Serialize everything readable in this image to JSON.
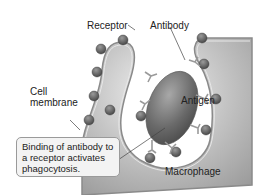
{
  "diagram": {
    "type": "biology-illustration",
    "labels": {
      "receptor": "Receptor",
      "antibody": "Antibody",
      "cell_membrane": "Cell\nmembrane",
      "cell_line1": "Cell",
      "cell_line2": "membrane",
      "antigen": "Antigen",
      "macrophage": "Macrophage"
    },
    "callout": {
      "line1": "Binding of antibody to",
      "line2": "a receptor activates",
      "line3": "phagocytosis."
    },
    "colors": {
      "macrophage_fill": "#b8b8b8",
      "macrophage_light": "#e4e4e4",
      "membrane_stroke": "#8a8a8a",
      "antigen_fill": "#6e6e6e",
      "receptor_fill": "#5a5a5a",
      "callout_bg": "#f3f3f3"
    }
  }
}
